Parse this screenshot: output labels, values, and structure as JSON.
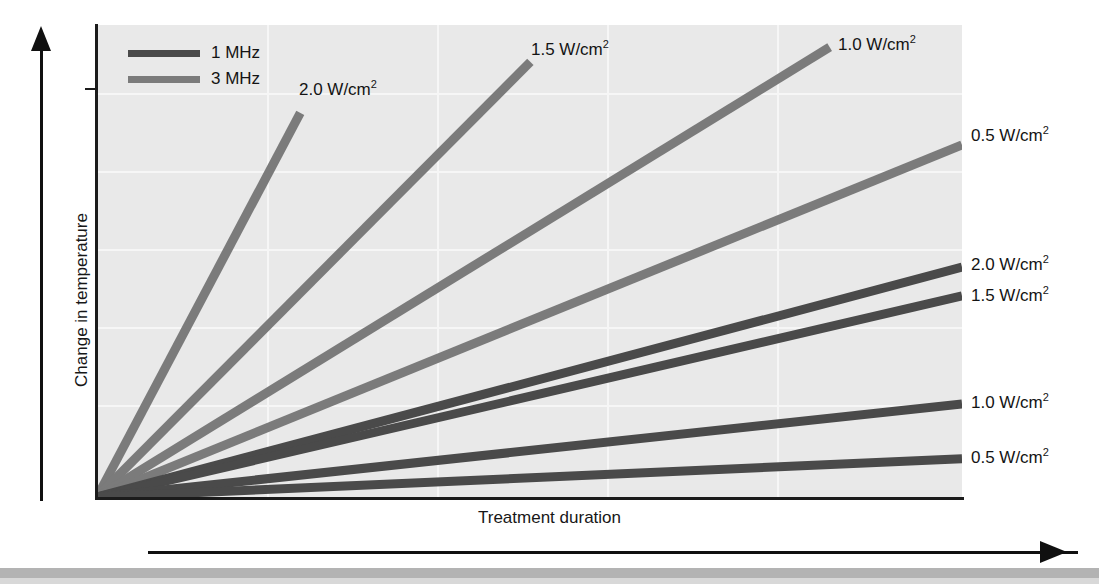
{
  "figure": {
    "background_color": "#ffffff",
    "plot_background_color": "#e9e9e9",
    "gridline_color": "#f6f6f6",
    "axis_color": "#1b1b1b"
  },
  "axes": {
    "x_title": "Treatment duration",
    "y_title": "Change in temperature"
  },
  "legend": {
    "items": [
      {
        "label": "1 MHz",
        "color": "#4a4a4a"
      },
      {
        "label": "3 MHz",
        "color": "#7b7b7b"
      }
    ]
  },
  "curve_labels": {
    "mhz3_2_0": "2.0 W/cm",
    "mhz3_1_5": "1.5 W/cm",
    "mhz3_1_0": "1.0 W/cm",
    "mhz3_0_5": "0.5 W/cm",
    "mhz1_2_0": "2.0 W/cm",
    "mhz1_1_5": "1.5 W/cm",
    "mhz1_1_0": "1.0 W/cm",
    "mhz1_0_5": "0.5 W/cm",
    "exponent": "2"
  },
  "chart_data": {
    "type": "line",
    "title": "",
    "subtitle": "",
    "xlabel": "Treatment duration",
    "ylabel": "Change in temperature",
    "xlim": [
      0,
      100
    ],
    "ylim": [
      0,
      100
    ],
    "x_tick_labels": [],
    "y_tick_labels": [],
    "grid": true,
    "legend_position": "top-left",
    "legend_entries": [
      "1 MHz",
      "3 MHz"
    ],
    "series": [
      {
        "name": "3 MHz 2.0 W/cm2",
        "frequency": "3 MHz",
        "intensity": "2.0 W/cm2",
        "color": "#7b7b7b",
        "x": [
          0,
          23.5
        ],
        "y": [
          0,
          81.4
        ],
        "endpoint_label": "2.0 W/cm2"
      },
      {
        "name": "3 MHz 1.5 W/cm2",
        "frequency": "3 MHz",
        "intensity": "1.5 W/cm2",
        "color": "#7b7b7b",
        "x": [
          0,
          50.1
        ],
        "y": [
          0,
          92.2
        ],
        "endpoint_label": "1.5 W/cm2"
      },
      {
        "name": "3 MHz 1.0 W/cm2",
        "frequency": "3 MHz",
        "intensity": "1.0 W/cm2",
        "color": "#7b7b7b",
        "x": [
          0,
          84.7
        ],
        "y": [
          0,
          95.3
        ],
        "endpoint_label": "1.0 W/cm2"
      },
      {
        "name": "3 MHz 0.5 W/cm2",
        "frequency": "3 MHz",
        "intensity": "0.5 W/cm2",
        "color": "#7b7b7b",
        "x": [
          0,
          100
        ],
        "y": [
          0,
          74.6
        ],
        "endpoint_label": "0.5 W/cm2"
      },
      {
        "name": "1 MHz 2.0 W/cm2",
        "frequency": "1 MHz",
        "intensity": "2.0 W/cm2",
        "color": "#4a4a4a",
        "x": [
          0,
          100
        ],
        "y": [
          0,
          48.7
        ],
        "endpoint_label": "2.0 W/cm2"
      },
      {
        "name": "1 MHz 1.5 W/cm2",
        "frequency": "1 MHz",
        "intensity": "1.5 W/cm2",
        "color": "#4a4a4a",
        "x": [
          0,
          100
        ],
        "y": [
          0,
          42.6
        ],
        "endpoint_label": "1.5 W/cm2"
      },
      {
        "name": "1 MHz 1.0 W/cm2",
        "frequency": "1 MHz",
        "intensity": "1.0 W/cm2",
        "color": "#4a4a4a",
        "x": [
          0,
          100
        ],
        "y": [
          0,
          19.7
        ],
        "endpoint_label": "1.0 W/cm2"
      },
      {
        "name": "1 MHz 0.5 W/cm2",
        "frequency": "1 MHz",
        "intensity": "0.5 W/cm2",
        "color": "#4a4a4a",
        "x": [
          0,
          100
        ],
        "y": [
          0,
          8.1
        ],
        "endpoint_label": "0.5 W/cm2"
      }
    ]
  }
}
